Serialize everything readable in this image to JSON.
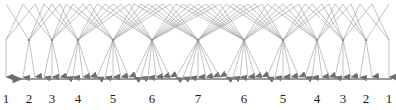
{
  "figure": {
    "title": "",
    "width": 396,
    "height": 110,
    "background_color": "#ffffff"
  },
  "axis": {
    "name": "stage-axis",
    "orientation": "horizontal",
    "direction": "leftward",
    "arrow_head": "left",
    "line_color": "#7a7a7a",
    "line_y": 79,
    "line_x_start": 3,
    "line_x_end": 392,
    "label_color": "#1a1a1a",
    "label_y": 92,
    "labels": [
      {
        "text": "1",
        "x": 6
      },
      {
        "text": "2",
        "x": 29
      },
      {
        "text": "3",
        "x": 52
      },
      {
        "text": "4",
        "x": 78
      },
      {
        "text": "5",
        "x": 113
      },
      {
        "text": "6",
        "x": 152
      },
      {
        "text": "7",
        "x": 198
      },
      {
        "text": "6",
        "x": 244
      },
      {
        "text": "5",
        "x": 283
      },
      {
        "text": "4",
        "x": 317
      },
      {
        "text": "3",
        "x": 343
      },
      {
        "text": "2",
        "x": 366
      },
      {
        "text": "1",
        "x": 389
      }
    ]
  },
  "trellis": {
    "name": "fan-trellis",
    "edge_color": "#9a9a9a",
    "edge_width": 0.6,
    "node_color": "#8a8a8a",
    "arrowhead_color": "#6e6e6e",
    "top_y": 4,
    "node_y": 40,
    "arrow_tip_y": 77,
    "node_count": 13,
    "description": "Symmetric fan-out / fan-in trellis: each numbered stage column carries a node where edges converge from the previous stage and diverge to the next. Every column terminates in downward arrowheads landing on the leftward axis.",
    "columns": [
      {
        "label": "1",
        "x": 6,
        "node_x": 6,
        "fan": 1,
        "arrow_xs": [
          6
        ]
      },
      {
        "label": "2",
        "x": 29,
        "node_x": 29,
        "fan": 2,
        "arrow_xs": [
          23,
          35
        ]
      },
      {
        "label": "3",
        "x": 52,
        "node_x": 52,
        "fan": 3,
        "arrow_xs": [
          44,
          52,
          60
        ]
      },
      {
        "label": "4",
        "x": 78,
        "node_x": 78,
        "fan": 4,
        "arrow_xs": [
          66,
          73,
          83,
          90
        ]
      },
      {
        "label": "5",
        "x": 113,
        "node_x": 113,
        "fan": 5,
        "arrow_xs": [
          97,
          105,
          113,
          121,
          129
        ]
      },
      {
        "label": "6",
        "x": 152,
        "node_x": 152,
        "fan": 6,
        "arrow_xs": [
          134,
          141,
          148,
          156,
          163,
          170
        ]
      },
      {
        "label": "7",
        "x": 198,
        "node_x": 198,
        "fan": 7,
        "arrow_xs": [
          176,
          183,
          190,
          198,
          206,
          213,
          220
        ]
      },
      {
        "label": "6",
        "x": 244,
        "node_x": 244,
        "fan": 6,
        "arrow_xs": [
          226,
          233,
          240,
          248,
          255,
          262
        ]
      },
      {
        "label": "5",
        "x": 283,
        "node_x": 283,
        "fan": 5,
        "arrow_xs": [
          267,
          275,
          283,
          291,
          299
        ]
      },
      {
        "label": "4",
        "x": 317,
        "node_x": 317,
        "fan": 4,
        "arrow_xs": [
          305,
          312,
          322,
          329
        ]
      },
      {
        "label": "3",
        "x": 343,
        "node_x": 343,
        "fan": 3,
        "arrow_xs": [
          335,
          343,
          351
        ]
      },
      {
        "label": "2",
        "x": 366,
        "node_x": 366,
        "fan": 2,
        "arrow_xs": [
          360,
          372
        ]
      },
      {
        "label": "1",
        "x": 389,
        "node_x": 389,
        "fan": 1,
        "arrow_xs": [
          389
        ]
      }
    ]
  },
  "chart_data": {
    "type": "diagram",
    "title": "",
    "xlabel": "",
    "ylabel": "",
    "categories": [
      "1",
      "2",
      "3",
      "4",
      "5",
      "6",
      "7",
      "6",
      "5",
      "4",
      "3",
      "2",
      "1"
    ],
    "values": [
      1,
      2,
      3,
      4,
      5,
      6,
      7,
      6,
      5,
      4,
      3,
      2,
      1
    ],
    "note": "Number of parallel branches (arrowheads) per stage column, rising 1..7 then falling 7..1"
  }
}
